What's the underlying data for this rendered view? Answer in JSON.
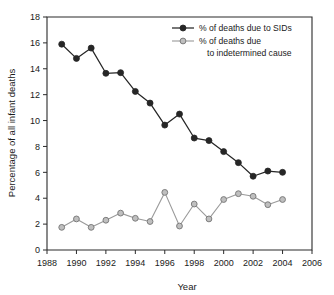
{
  "chart_data": {
    "type": "line",
    "title": "",
    "xlabel": "Year",
    "ylabel": "Percentage of all infant deaths",
    "xlim": [
      1988,
      2006
    ],
    "ylim": [
      0,
      18
    ],
    "xticks": [
      1988,
      1990,
      1992,
      1994,
      1996,
      1998,
      2000,
      2002,
      2004,
      2006
    ],
    "yticks": [
      0,
      2,
      4,
      6,
      8,
      10,
      12,
      14,
      16,
      18
    ],
    "grid": false,
    "legend_position": "top-right",
    "x": [
      1989,
      1990,
      1991,
      1992,
      1993,
      1994,
      1995,
      1996,
      1997,
      1998,
      1999,
      2000,
      2001,
      2002,
      2003,
      2004
    ],
    "series": [
      {
        "name": "% of deaths due to SIDs",
        "color": "#262626",
        "marker": "filled-circle",
        "values": [
          15.9,
          14.8,
          15.6,
          13.65,
          13.7,
          12.25,
          11.35,
          9.65,
          10.5,
          8.65,
          8.45,
          7.6,
          6.75,
          5.7,
          6.1,
          6.0
        ]
      },
      {
        "name": "% of deaths due to indetermined cause",
        "color": "#9a9a9a",
        "marker": "open-circle",
        "values": [
          1.75,
          2.4,
          1.75,
          2.3,
          2.85,
          2.45,
          2.2,
          4.45,
          1.85,
          3.55,
          2.4,
          3.9,
          4.35,
          4.15,
          3.5,
          3.9
        ]
      }
    ]
  },
  "axes": {
    "x_title": "Year",
    "y_title": "Percentage of all infant deaths",
    "x_tick_labels": [
      "1988",
      "1990",
      "1992",
      "1994",
      "1996",
      "1998",
      "2000",
      "2002",
      "2004",
      "2006"
    ],
    "y_tick_labels": [
      "0",
      "2",
      "4",
      "6",
      "8",
      "10",
      "12",
      "14",
      "16",
      "18"
    ]
  },
  "legend": {
    "entries": [
      {
        "label": "% of deaths due to SIDs",
        "color": "#262626"
      },
      {
        "label": "% of deaths due",
        "label_line2": "to indetermined cause",
        "color": "#9a9a9a"
      }
    ],
    "entry1_label": "% of deaths due to SIDs",
    "entry2_label_line1": "% of deaths due",
    "entry2_label_line2": "to indetermined cause"
  },
  "colors": {
    "sids_series": "#262626",
    "indetermined_series": "#9a9a9a",
    "axis": "#2b2b2b",
    "background": "#ffffff"
  }
}
